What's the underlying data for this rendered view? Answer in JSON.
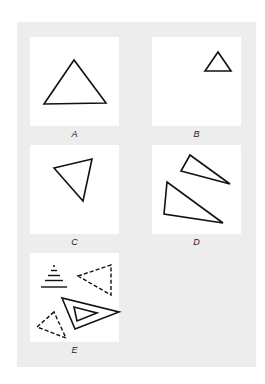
{
  "figure": {
    "panels": [
      {
        "id": "A",
        "label": "A",
        "description": "single large triangle"
      },
      {
        "id": "B",
        "label": "B",
        "description": "single small triangle in upper right"
      },
      {
        "id": "C",
        "label": "C",
        "description": "rotated triangle"
      },
      {
        "id": "D",
        "label": "D",
        "description": "two elongated triangles"
      },
      {
        "id": "E",
        "label": "E",
        "description": "stacked lines, dashed triangles, nested double triangle"
      }
    ],
    "colors": {
      "background": "#ededed",
      "panel": "#ffffff",
      "stroke": "#111111"
    }
  }
}
